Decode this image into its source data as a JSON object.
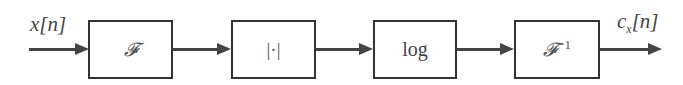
{
  "diagram": {
    "type": "signal-flow-block-diagram",
    "input_label": "x[n]",
    "output_label_main": "c",
    "output_label_sub": "x",
    "output_label_tail": "[n]",
    "blocks": [
      {
        "id": "fourier",
        "label": "𝓕"
      },
      {
        "id": "magnitude",
        "label": "|·|"
      },
      {
        "id": "log",
        "label": "log"
      },
      {
        "id": "inverse-fourier",
        "label": "𝓕",
        "superscript": "−1"
      }
    ],
    "connections": [
      {
        "from": "input",
        "to": "fourier"
      },
      {
        "from": "fourier",
        "to": "magnitude"
      },
      {
        "from": "magnitude",
        "to": "log"
      },
      {
        "from": "log",
        "to": "inverse-fourier"
      },
      {
        "from": "inverse-fourier",
        "to": "output"
      }
    ]
  }
}
